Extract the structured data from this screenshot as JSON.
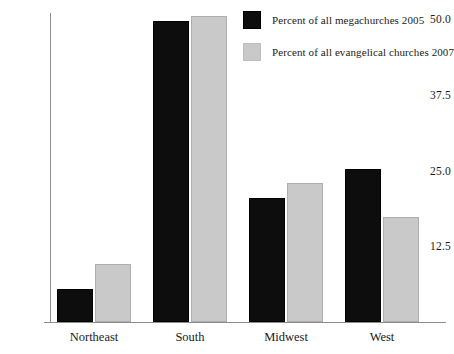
{
  "chart_data": {
    "type": "bar",
    "title": "",
    "subtitle": "",
    "xlabel": "",
    "ylabel": "",
    "categories": [
      "Northeast",
      "South",
      "Midwest",
      "West"
    ],
    "series": [
      {
        "name": "Percent of all megachurches 2005",
        "color": "#0d0d0d",
        "values": [
          5.4,
          49.7,
          20.5,
          25.2
        ]
      },
      {
        "name": "Percent of all evangelical churches 2007",
        "color": "#c9c9c9",
        "values": [
          9.6,
          50.5,
          23.0,
          17.3
        ]
      }
    ],
    "ylim": [
      0,
      52.5
    ],
    "yticks": [
      12.5,
      25.0,
      37.5,
      50.0
    ],
    "ytick_labels": [
      "12.5",
      "25.0",
      "37.5",
      "50.0"
    ],
    "grid": false,
    "legend_position": "top-right"
  }
}
